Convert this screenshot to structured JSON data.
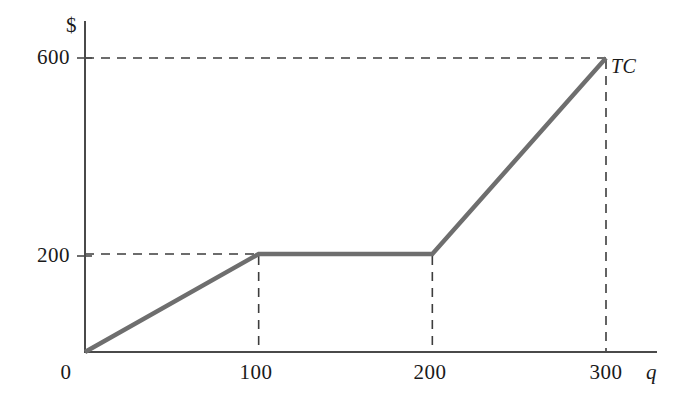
{
  "chart_data": {
    "type": "line",
    "title": "",
    "subtitle": "",
    "xlabel": "q",
    "ylabel": "$",
    "xlim": [
      0,
      330
    ],
    "ylim": [
      0,
      660
    ],
    "grid": false,
    "legend_position": "inline-right",
    "x_ticks": [
      {
        "value": 0,
        "label": "0"
      },
      {
        "value": 100,
        "label": "100"
      },
      {
        "value": 200,
        "label": "200"
      },
      {
        "value": 300,
        "label": "300"
      }
    ],
    "y_ticks": [
      {
        "value": 200,
        "label": "200"
      },
      {
        "value": 600,
        "label": "600"
      }
    ],
    "series": [
      {
        "name": "TC",
        "label": "TC",
        "color": "#6e6e6e",
        "points": [
          {
            "x": 0,
            "y": 0
          },
          {
            "x": 100,
            "y": 200
          },
          {
            "x": 200,
            "y": 200
          },
          {
            "x": 300,
            "y": 600
          }
        ]
      }
    ],
    "annotations": [
      {
        "name": "guide-h-600",
        "kind": "dashed-horizontal",
        "y": 600,
        "x_from": 0,
        "x_to": 300
      },
      {
        "name": "guide-h-200",
        "kind": "dashed-horizontal",
        "y": 200,
        "x_from": 0,
        "x_to": 100
      },
      {
        "name": "guide-v-100",
        "kind": "dashed-vertical",
        "x": 100,
        "y_from": 0,
        "y_to": 200
      },
      {
        "name": "guide-v-200",
        "kind": "dashed-vertical",
        "x": 200,
        "y_from": 0,
        "y_to": 200
      },
      {
        "name": "guide-v-300",
        "kind": "dashed-vertical",
        "x": 300,
        "y_from": 0,
        "y_to": 600
      }
    ]
  },
  "axes": {
    "y_axis_title": "$",
    "x_axis_title": "q",
    "origin_label": "0"
  },
  "labels": {
    "y_tick_600": "600",
    "y_tick_200": "200",
    "x_tick_0": "0",
    "x_tick_100": "100",
    "x_tick_200": "200",
    "x_tick_300": "300",
    "curve_label": "TC"
  },
  "colors": {
    "curve": "#6e6e6e",
    "axis": "#4a4a4a",
    "dash": "#3d3d3d",
    "text": "#1a1a1a",
    "background": "#ffffff"
  }
}
